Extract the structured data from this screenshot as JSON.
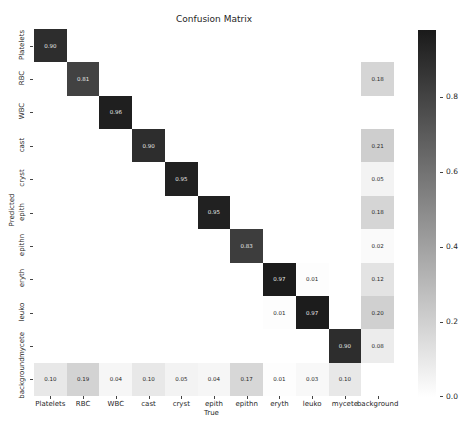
{
  "chart_data": {
    "type": "heatmap",
    "title": "Confusion Matrix",
    "xlabel": "True",
    "ylabel": "Predicted",
    "x_categories": [
      "Platelets",
      "RBC",
      "WBC",
      "cast",
      "cryst",
      "epith",
      "epithn",
      "eryth",
      "leuko",
      "mycete",
      "background"
    ],
    "y_categories": [
      "Platelets",
      "RBC",
      "WBC",
      "cast",
      "cryst",
      "epith",
      "epithn",
      "eryth",
      "leuko",
      "mycete",
      "background"
    ],
    "values": [
      [
        0.9,
        null,
        null,
        null,
        null,
        null,
        null,
        null,
        null,
        null,
        null
      ],
      [
        null,
        0.81,
        null,
        null,
        null,
        null,
        null,
        null,
        null,
        null,
        0.18
      ],
      [
        null,
        null,
        0.96,
        null,
        null,
        null,
        null,
        null,
        null,
        null,
        null
      ],
      [
        null,
        null,
        null,
        0.9,
        null,
        null,
        null,
        null,
        null,
        null,
        0.21
      ],
      [
        null,
        null,
        null,
        null,
        0.95,
        null,
        null,
        null,
        null,
        null,
        0.05
      ],
      [
        null,
        null,
        null,
        null,
        null,
        0.95,
        null,
        null,
        null,
        null,
        0.18
      ],
      [
        null,
        null,
        null,
        null,
        null,
        null,
        0.83,
        null,
        null,
        null,
        0.02
      ],
      [
        null,
        null,
        null,
        null,
        null,
        null,
        null,
        0.97,
        0.01,
        null,
        0.12
      ],
      [
        null,
        null,
        null,
        null,
        null,
        null,
        null,
        0.01,
        0.97,
        null,
        0.2
      ],
      [
        null,
        null,
        null,
        null,
        null,
        null,
        null,
        null,
        null,
        0.9,
        0.08
      ],
      [
        0.1,
        0.19,
        0.04,
        0.1,
        0.05,
        0.04,
        0.17,
        0.01,
        0.03,
        0.1,
        null
      ]
    ],
    "colorbar": {
      "min": 0.0,
      "max": 0.98,
      "ticks": [
        "0.0",
        "0.2",
        "0.4",
        "0.6",
        "0.8"
      ],
      "colormap": "Greys"
    },
    "grid": false,
    "legend_position": "right (colorbar)"
  },
  "colors": {
    "low": "#ffffff",
    "high": "#1a1a1a",
    "text_dark": "#262626",
    "text_light": "#e8e8e8"
  }
}
